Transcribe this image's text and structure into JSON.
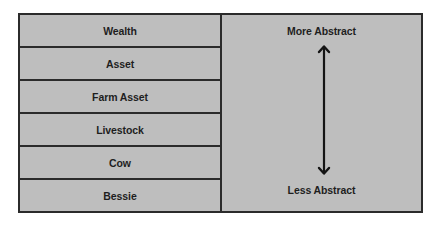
{
  "hierarchy": {
    "levels": [
      {
        "label": "Wealth"
      },
      {
        "label": "Asset"
      },
      {
        "label": "Farm Asset"
      },
      {
        "label": "Livestock"
      },
      {
        "label": "Cow"
      },
      {
        "label": "Bessie"
      }
    ]
  },
  "scale": {
    "top_label": "More Abstract",
    "bottom_label": "Less Abstract",
    "arrow": "double-headed-vertical-arrow-icon"
  },
  "colors": {
    "fill": "#bebebe",
    "border": "#2b2b2b",
    "text": "#1e1e1e"
  }
}
